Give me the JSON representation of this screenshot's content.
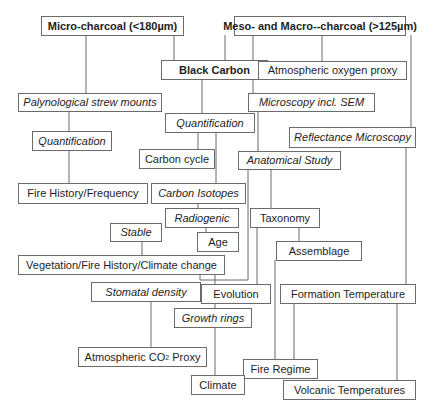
{
  "diagram": {
    "type": "charcoal-analysis-flowchart",
    "nodes": [
      {
        "id": "micro",
        "label": "Micro-charcoal (<180µm)",
        "style": "bold"
      },
      {
        "id": "meso",
        "label": "Meso- and Macro--charcoal (>125µm)",
        "style": "bold"
      },
      {
        "id": "blackcarbon",
        "label": "Black Carbon",
        "style": "bold"
      },
      {
        "id": "atmo2",
        "label": "Atmospheric oxygen proxy",
        "style": "normal"
      },
      {
        "id": "palyno",
        "label": "Palynological strew mounts",
        "style": "italic"
      },
      {
        "id": "sem",
        "label": "Microscopy incl. SEM",
        "style": "italic"
      },
      {
        "id": "quant1",
        "label": "Quantification",
        "style": "italic"
      },
      {
        "id": "quant2",
        "label": "Quantification",
        "style": "italic"
      },
      {
        "id": "reflect",
        "label": "Reflectance Microscopy",
        "style": "italic"
      },
      {
        "id": "carboncycle",
        "label": "Carbon cycle",
        "style": "normal"
      },
      {
        "id": "anatom",
        "label": "Anatomical Study",
        "style": "italic"
      },
      {
        "id": "firehist",
        "label": "Fire History/Frequency",
        "style": "normal"
      },
      {
        "id": "isotopes",
        "label": "Carbon Isotopes",
        "style": "italic"
      },
      {
        "id": "radio",
        "label": "Radiogenic",
        "style": "italic"
      },
      {
        "id": "taxonomy",
        "label": "Taxonomy",
        "style": "normal"
      },
      {
        "id": "stable",
        "label": "Stable",
        "style": "italic"
      },
      {
        "id": "age",
        "label": "Age",
        "style": "normal"
      },
      {
        "id": "assemblage",
        "label": "Assemblage",
        "style": "normal"
      },
      {
        "id": "vegetation",
        "label": "Vegetation/Fire History/Climate change",
        "style": "normal"
      },
      {
        "id": "stomatal",
        "label": "Stomatal density",
        "style": "italic"
      },
      {
        "id": "evolution",
        "label": "Evolution",
        "style": "normal"
      },
      {
        "id": "formtemp",
        "label": "Formation Temperature",
        "style": "normal"
      },
      {
        "id": "growth",
        "label": "Growth rings",
        "style": "italic"
      },
      {
        "id": "co2",
        "label": "Atmospheric CO",
        "label_sub": "2",
        "label_suffix": " Proxy",
        "style": "normal"
      },
      {
        "id": "fireregime",
        "label": "Fire Regime",
        "style": "normal"
      },
      {
        "id": "climate",
        "label": "Climate",
        "style": "normal"
      },
      {
        "id": "volcanic",
        "label": "Volcanic Temperatures",
        "style": "normal"
      }
    ],
    "edges": [
      {
        "from": "micro",
        "to": "palyno"
      },
      {
        "from": "micro",
        "to": "blackcarbon"
      },
      {
        "from": "meso",
        "to": "blackcarbon"
      },
      {
        "from": "meso",
        "to": "atmo2"
      },
      {
        "from": "meso",
        "to": "sem"
      },
      {
        "from": "meso",
        "to": "reflect"
      },
      {
        "from": "palyno",
        "to": "quant1"
      },
      {
        "from": "quant1",
        "to": "firehist"
      },
      {
        "from": "blackcarbon",
        "to": "quant2"
      },
      {
        "from": "quant2",
        "to": "carboncycle"
      },
      {
        "from": "quant2",
        "to": "isotopes"
      },
      {
        "from": "isotopes",
        "to": "radio"
      },
      {
        "from": "radio",
        "to": "age"
      },
      {
        "from": "stable",
        "to": "vegetation"
      },
      {
        "from": "sem",
        "to": "anatom"
      },
      {
        "from": "anatom",
        "to": "taxonomy"
      },
      {
        "from": "anatom",
        "to": "vegetation"
      },
      {
        "from": "taxonomy",
        "to": "assemblage"
      },
      {
        "from": "taxonomy",
        "to": "evolution"
      },
      {
        "from": "assemblage",
        "to": "fireregime"
      },
      {
        "from": "vegetation",
        "to": "evolution"
      },
      {
        "from": "stomatal",
        "to": "co2"
      },
      {
        "from": "evolution",
        "to": "growth"
      },
      {
        "from": "growth",
        "to": "climate"
      },
      {
        "from": "reflect",
        "to": "formtemp"
      },
      {
        "from": "formtemp",
        "to": "fireregime"
      },
      {
        "from": "formtemp",
        "to": "volcanic"
      }
    ]
  }
}
